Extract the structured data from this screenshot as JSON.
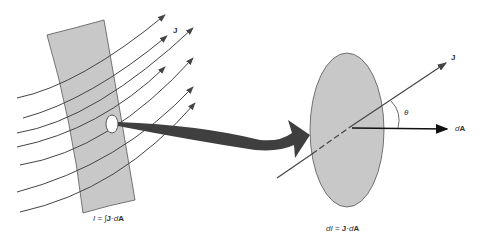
{
  "diagram": {
    "left": {
      "vector_label": "J",
      "equation": {
        "lhs": "I",
        "eq": " = ",
        "integral": "∫",
        "vec": "J",
        "dot": "·",
        "d": "d",
        "area": "A"
      }
    },
    "right": {
      "vector_label": "J",
      "area_label_d": "d",
      "area_label_A": "A",
      "angle_label": "θ",
      "equation": {
        "lhs_d": "d",
        "lhs": "I",
        "eq": " = ",
        "vec": "J",
        "dot": "·",
        "d": "d",
        "area": "A"
      }
    },
    "colors": {
      "surface_fill": "#c8c8c8",
      "line": "#444444",
      "arrow_fill": "#3f3f3f"
    }
  }
}
